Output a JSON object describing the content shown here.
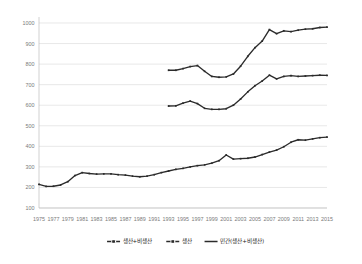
{
  "chart_data": {
    "type": "line",
    "title": "",
    "subtitle": "",
    "xlabel": "",
    "ylabel": "",
    "xlim": [
      1975,
      2015
    ],
    "ylim": [
      100,
      1000
    ],
    "ytick_step": 100,
    "xtick_step": 2,
    "grid": true,
    "legend_position": "bottom",
    "ytick_labels": [
      "1000",
      "900",
      "800",
      "700",
      "600",
      "500",
      "400",
      "300",
      "200",
      "100"
    ],
    "ytick_values": [
      1000,
      900,
      800,
      700,
      600,
      500,
      400,
      300,
      200,
      100
    ],
    "xtick_labels": [
      "1975",
      "1977",
      "1979",
      "1981",
      "1983",
      "1985",
      "1987",
      "1989",
      "1991",
      "1993",
      "1995",
      "1997",
      "1999",
      "2001",
      "2003",
      "2005",
      "2007",
      "2009",
      "2011",
      "2013",
      "2015"
    ],
    "xtick_values": [
      1975,
      1977,
      1979,
      1981,
      1983,
      1985,
      1987,
      1989,
      1991,
      1993,
      1995,
      1997,
      1999,
      2001,
      2003,
      2005,
      2007,
      2009,
      2011,
      2013,
      2015
    ],
    "series": [
      {
        "name": "생산+비생산",
        "marker": "dash-dot-dash",
        "color": "#2b2b2b",
        "x": [
          1993,
          1994,
          1995,
          1996,
          1997,
          1998,
          1999,
          2000,
          2001,
          2002,
          2003,
          2004,
          2005,
          2006,
          2007,
          2008,
          2009,
          2010,
          2011,
          2012,
          2013,
          2014,
          2015
        ],
        "values": [
          770,
          770,
          778,
          788,
          793,
          765,
          740,
          736,
          738,
          752,
          790,
          838,
          880,
          912,
          968,
          948,
          962,
          958,
          965,
          970,
          972,
          978,
          980
        ]
      },
      {
        "name": "생산",
        "marker": "dash-dot-dash",
        "color": "#2b2b2b",
        "x": [
          1993,
          1994,
          1995,
          1996,
          1997,
          1998,
          1999,
          2000,
          2001,
          2002,
          2003,
          2004,
          2005,
          2006,
          2007,
          2008,
          2009,
          2010,
          2011,
          2012,
          2013,
          2014,
          2015
        ],
        "values": [
          596,
          597,
          610,
          620,
          608,
          585,
          580,
          580,
          583,
          600,
          630,
          665,
          695,
          718,
          746,
          728,
          740,
          744,
          740,
          742,
          744,
          746,
          745
        ]
      },
      {
        "name": "민간(생산+비생산)",
        "marker": "solid",
        "color": "#2b2b2b",
        "x": [
          1975,
          1976,
          1977,
          1978,
          1979,
          1980,
          1981,
          1982,
          1983,
          1984,
          1985,
          1986,
          1987,
          1988,
          1989,
          1990,
          1991,
          1992,
          1993,
          1994,
          1995,
          1996,
          1997,
          1998,
          1999,
          2000,
          2001,
          2002,
          2003,
          2004,
          2005,
          2006,
          2007,
          2008,
          2009,
          2010,
          2011,
          2012,
          2013,
          2014,
          2015
        ],
        "values": [
          215,
          205,
          206,
          212,
          228,
          258,
          272,
          268,
          265,
          266,
          266,
          262,
          260,
          255,
          252,
          255,
          262,
          272,
          280,
          288,
          293,
          300,
          306,
          310,
          318,
          330,
          358,
          338,
          340,
          342,
          348,
          360,
          372,
          382,
          398,
          420,
          432,
          430,
          436,
          442,
          445
        ]
      }
    ],
    "legend": [
      {
        "label": "생산+비생산",
        "marker": "dash-dot-dash"
      },
      {
        "label": "생산",
        "marker": "dash-dot-dash"
      },
      {
        "label": "민간(생산+비생산)",
        "marker": "solid"
      }
    ]
  }
}
